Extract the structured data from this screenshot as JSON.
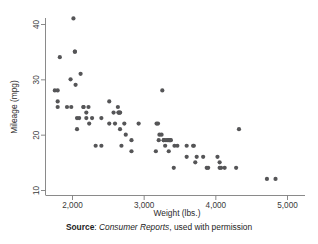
{
  "figure": {
    "background_color": "#ffffff",
    "point_color": "#555557",
    "axis_color": "#7d7d7d"
  },
  "caption": {
    "label": "Source",
    "separator": ": ",
    "publication": "Consumer Reports",
    "rest": ", used with permission"
  },
  "chart_data": {
    "type": "scatter",
    "title": "",
    "xlabel": "Weight (lbs.)",
    "ylabel": "Mileage (mpg)",
    "xlim": [
      1730,
      5000
    ],
    "ylim": [
      9,
      42
    ],
    "xticks": [
      2000,
      3000,
      4000,
      5000
    ],
    "xtick_labels": [
      "2,000",
      "3,000",
      "4,000",
      "5,000"
    ],
    "yticks": [
      10,
      20,
      30,
      40
    ],
    "ytick_labels": [
      "10",
      "20",
      "30",
      "40"
    ],
    "grid": false,
    "legend": false,
    "marker": "circle",
    "marker_size": 3.1,
    "n_points": 74,
    "x": [
      1760,
      1800,
      1800,
      1830,
      1800,
      1930,
      1980,
      1990,
      2020,
      2040,
      2040,
      2050,
      2070,
      2070,
      2100,
      2120,
      2160,
      2160,
      2200,
      2200,
      2230,
      2240,
      2280,
      2330,
      2410,
      2410,
      2520,
      2520,
      2580,
      2600,
      2640,
      2650,
      2650,
      2670,
      2670,
      2670,
      2690,
      2730,
      2750,
      2830,
      2830,
      2930,
      3170,
      3180,
      3200,
      3210,
      3220,
      3250,
      3260,
      3280,
      3280,
      3300,
      3310,
      3330,
      3350,
      3350,
      3360,
      3370,
      3380,
      3420,
      3430,
      3470,
      3600,
      3600,
      3690,
      3700,
      3720,
      3740,
      3830,
      3880,
      3900,
      4030,
      4060,
      4060,
      4080,
      4130,
      4290,
      4330,
      4720,
      4840
    ],
    "y": [
      28,
      28,
      26,
      34,
      25,
      25,
      30,
      25,
      41,
      35,
      35,
      29,
      23,
      21,
      23,
      31,
      25,
      25,
      24,
      23,
      25,
      22,
      23,
      18,
      23,
      18,
      26,
      22,
      24,
      22,
      25,
      24,
      24,
      24,
      24,
      21,
      18,
      22,
      20,
      17,
      19,
      22,
      17,
      22,
      22,
      19,
      20,
      20,
      28,
      19,
      19,
      18,
      19,
      19,
      19,
      17,
      19,
      19,
      19,
      14,
      18,
      18,
      18,
      16,
      18,
      18,
      15,
      16,
      16,
      14,
      14,
      16,
      14,
      15,
      14,
      14,
      14,
      21,
      12,
      12
    ],
    "series": [
      {
        "name": "cars",
        "color": "#555557",
        "description": "Mileage versus weight for 1978 automobiles"
      }
    ],
    "annotations": []
  }
}
